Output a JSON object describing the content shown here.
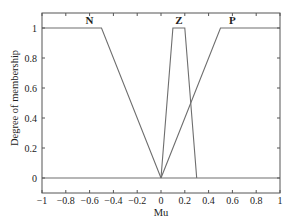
{
  "chart_data": {
    "type": "line",
    "title": "",
    "xlabel": "Mu",
    "ylabel": "Degree of membership",
    "xlim": [
      -1,
      1
    ],
    "ylim": [
      -0.1,
      1.1
    ],
    "grid": false,
    "legend": "none",
    "xticks": [
      -1,
      -0.8,
      -0.6,
      -0.4,
      -0.2,
      0,
      0.2,
      0.4,
      0.6,
      0.8,
      1
    ],
    "xtick_labels": [
      "−1",
      "−0.8",
      "−0.6",
      "−0.4",
      "−0.2",
      "0",
      "0.2",
      "0.4",
      "0.6",
      "0.8",
      "1"
    ],
    "yticks": [
      0,
      0.2,
      0.4,
      0.6,
      0.8,
      1
    ],
    "ytick_labels": [
      "0",
      "0.2",
      "0.4",
      "0.6",
      "0.8",
      "1"
    ],
    "series": [
      {
        "name": "N",
        "label_x": -0.6,
        "x": [
          -1,
          -0.5,
          0
        ],
        "y": [
          1,
          1,
          0
        ]
      },
      {
        "name": "Z",
        "label_x": 0.15,
        "x": [
          0,
          0.1,
          0.2,
          0.3
        ],
        "y": [
          0,
          1,
          1,
          0
        ]
      },
      {
        "name": "P",
        "label_x": 0.6,
        "x": [
          0,
          0.5,
          1
        ],
        "y": [
          0,
          1,
          1
        ]
      },
      {
        "name": "baseline",
        "label_x": null,
        "x": [
          -1,
          1
        ],
        "y": [
          0,
          0
        ]
      }
    ],
    "colors": {
      "line": "#6e6e6e",
      "axes": "#555555",
      "text": "#222222"
    }
  }
}
